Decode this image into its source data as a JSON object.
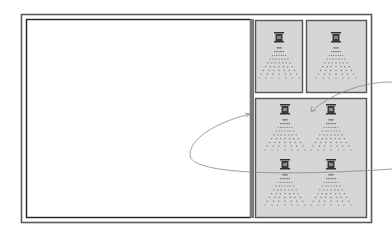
{
  "diagram": {
    "colors": {
      "frame": "#5a5a5a",
      "panel_fill": "#d6d6d6",
      "panel_border": "#555555",
      "wall": "#7a7a7a",
      "sprinkler": "#333333",
      "spray_dots": "#666666",
      "curve": "#888888"
    },
    "open_area": {
      "label": ""
    },
    "panels": [
      {
        "id": "panel-top-left",
        "sprinklers": 1
      },
      {
        "id": "panel-top-right",
        "sprinklers": 1
      },
      {
        "id": "panel-bottom",
        "sprinklers": 4
      }
    ],
    "arrows": [
      {
        "id": "loop-arrow",
        "from": "right-edge",
        "to": "wall-divider"
      },
      {
        "id": "pointer-arrow",
        "from": "right-edge",
        "to": "panel-bottom"
      }
    ]
  }
}
